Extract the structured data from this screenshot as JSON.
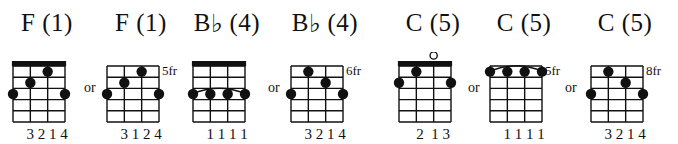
{
  "page": {
    "width": 678,
    "height": 144,
    "background": "#ffffff",
    "ink": "#111111",
    "instrument_strings": 4,
    "fret_rows": 5
  },
  "separators": [
    {
      "label": "or",
      "x": 84
    },
    {
      "label": "or",
      "x": 268
    },
    {
      "label": "or",
      "x": 468
    },
    {
      "label": "or",
      "x": 565
    }
  ],
  "chords": [
    {
      "id": "f-open",
      "name": "F",
      "root": "F",
      "accidental": "",
      "degree": "(1)",
      "title": "F (1)",
      "position_label": "",
      "has_nut": true,
      "barre": null,
      "open_strings": [],
      "muted_strings": [],
      "dots": [
        {
          "string": 3,
          "fret": 1
        },
        {
          "string": 2,
          "fret": 2
        },
        {
          "string": 1,
          "fret": 3
        },
        {
          "string": 4,
          "fret": 3
        }
      ],
      "fingers": "3 2 1 4",
      "x": 10,
      "width": 74
    },
    {
      "id": "f-5fr",
      "name": "F",
      "root": "F",
      "accidental": "",
      "degree": "(1)",
      "title": "F (1)",
      "position_label": "5fr",
      "has_nut": false,
      "barre": null,
      "open_strings": [],
      "muted_strings": [],
      "dots": [
        {
          "string": 3,
          "fret": 1
        },
        {
          "string": 2,
          "fret": 2
        },
        {
          "string": 1,
          "fret": 3
        },
        {
          "string": 4,
          "fret": 3
        }
      ],
      "fingers": "3 1 2 4",
      "x": 104,
      "width": 74
    },
    {
      "id": "bb-open",
      "name": "Bb",
      "root": "B",
      "accidental": "♭",
      "degree": "(4)",
      "title": "B♭ (4)",
      "position_label": "",
      "has_nut": true,
      "barre": {
        "fret": 3,
        "from_string": 1,
        "to_string": 4
      },
      "open_strings": [],
      "muted_strings": [],
      "dots": [
        {
          "string": 1,
          "fret": 3
        },
        {
          "string": 2,
          "fret": 3
        },
        {
          "string": 3,
          "fret": 3
        },
        {
          "string": 4,
          "fret": 3
        }
      ],
      "fingers": "1 1 1 1",
      "x": 190,
      "width": 74
    },
    {
      "id": "bb-6fr",
      "name": "Bb",
      "root": "B",
      "accidental": "♭",
      "degree": "(4)",
      "title": "B♭ (4)",
      "position_label": "6fr",
      "has_nut": false,
      "barre": null,
      "open_strings": [],
      "muted_strings": [],
      "dots": [
        {
          "string": 2,
          "fret": 1
        },
        {
          "string": 3,
          "fret": 2
        },
        {
          "string": 1,
          "fret": 3
        },
        {
          "string": 4,
          "fret": 3
        }
      ],
      "fingers": "3 2 1 4",
      "x": 288,
      "width": 74
    },
    {
      "id": "c-open",
      "name": "C",
      "root": "C",
      "accidental": "",
      "degree": "(5)",
      "title": "C (5)",
      "position_label": "",
      "has_nut": true,
      "barre": null,
      "open_strings": [
        3
      ],
      "muted_strings": [],
      "dots": [
        {
          "string": 2,
          "fret": 1
        },
        {
          "string": 1,
          "fret": 2
        },
        {
          "string": 4,
          "fret": 2
        }
      ],
      "fingers": "2  1 3",
      "x": 396,
      "width": 74
    },
    {
      "id": "c-5fr",
      "name": "C",
      "root": "C",
      "accidental": "",
      "degree": "(5)",
      "title": "C (5)",
      "position_label": "5fr",
      "has_nut": false,
      "barre": {
        "fret": 1,
        "from_string": 1,
        "to_string": 4
      },
      "open_strings": [],
      "muted_strings": [],
      "dots": [
        {
          "string": 1,
          "fret": 1
        },
        {
          "string": 2,
          "fret": 1
        },
        {
          "string": 3,
          "fret": 1
        },
        {
          "string": 4,
          "fret": 1
        }
      ],
      "fingers": "1 1 1 1",
      "x": 487,
      "width": 74
    },
    {
      "id": "c-8fr",
      "name": "C",
      "root": "C",
      "accidental": "",
      "degree": "(5)",
      "title": "C (5)",
      "position_label": "8fr",
      "has_nut": false,
      "barre": null,
      "open_strings": [],
      "muted_strings": [],
      "dots": [
        {
          "string": 2,
          "fret": 1
        },
        {
          "string": 3,
          "fret": 2
        },
        {
          "string": 1,
          "fret": 3
        },
        {
          "string": 4,
          "fret": 3
        }
      ],
      "fingers": "3 2 1 4",
      "x": 588,
      "width": 74
    }
  ]
}
